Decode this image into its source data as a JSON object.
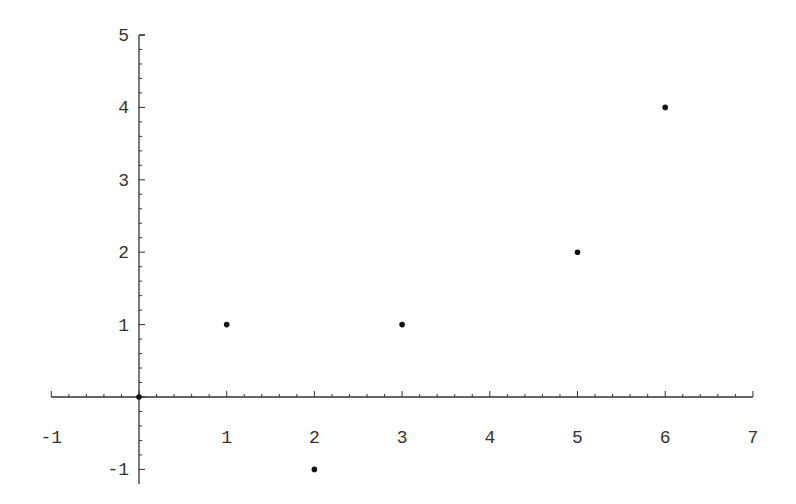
{
  "chart_data": {
    "type": "scatter",
    "title": "",
    "xlabel": "",
    "ylabel": "",
    "xlim": [
      -1,
      7
    ],
    "ylim": [
      -1.2,
      5
    ],
    "grid": false,
    "legend": null,
    "x_ticks": [
      -1,
      1,
      2,
      3,
      4,
      5,
      6,
      7
    ],
    "y_ticks": [
      -1,
      1,
      2,
      3,
      4,
      5
    ],
    "series": [
      {
        "name": "points",
        "color": "#111111",
        "points": [
          {
            "x": 0,
            "y": 0
          },
          {
            "x": 1,
            "y": 1
          },
          {
            "x": 2,
            "y": -1
          },
          {
            "x": 3,
            "y": 1
          },
          {
            "x": 5,
            "y": 2
          },
          {
            "x": 6,
            "y": 4
          }
        ]
      }
    ]
  },
  "colors": {
    "axis": "#333333",
    "point": "#111111",
    "background": "#ffffff"
  }
}
